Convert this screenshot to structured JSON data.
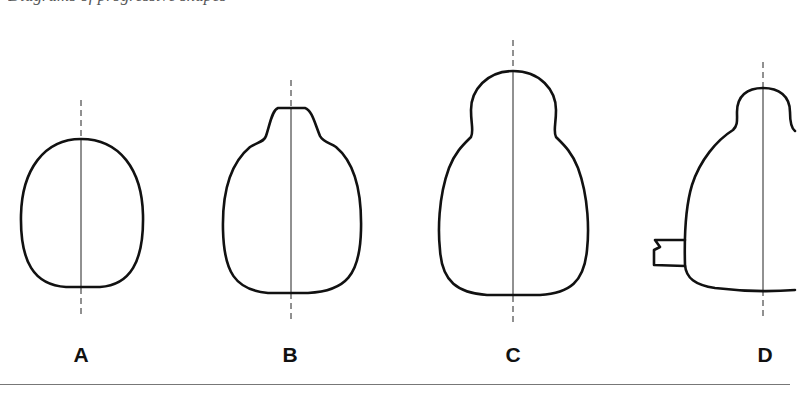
{
  "caption": {
    "text": "Diagrams of progressive shapes"
  },
  "figure": {
    "panels": [
      {
        "id": "A",
        "label": "A",
        "description": "Oval outline with vertical dashed axis"
      },
      {
        "id": "B",
        "label": "B",
        "description": "Oval with small flattened knob on top"
      },
      {
        "id": "C",
        "label": "C",
        "description": "Pear shape with large rounded head"
      },
      {
        "id": "D",
        "label": "D",
        "description": "Pear shape with rounded head and side stub, clipped at right edge"
      }
    ]
  },
  "colors": {
    "stroke": "#111111",
    "background": "#ffffff",
    "rule": "#777777"
  }
}
